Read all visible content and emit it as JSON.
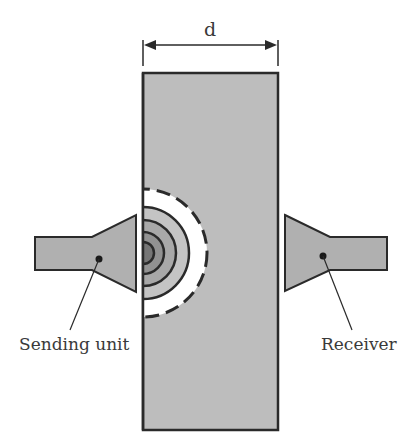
{
  "diagram": {
    "dimension": {
      "label": "d",
      "meaning": "plate thickness"
    },
    "components": {
      "sender": {
        "label": "Sending unit"
      },
      "receiver": {
        "label": "Receiver"
      },
      "specimen": {
        "label": ""
      },
      "wavefront": {
        "rings": 4,
        "outer_ring_style": "dashed"
      }
    },
    "colors": {
      "specimen_fill": "#bdbdbd",
      "transducer_fill": "#b0b0b0",
      "stroke": "#2a2a2a",
      "ring_fills": [
        "#7a7a7a",
        "#909090",
        "#a6a6a6",
        "#b8b8b8"
      ],
      "background": "#ffffff"
    }
  }
}
